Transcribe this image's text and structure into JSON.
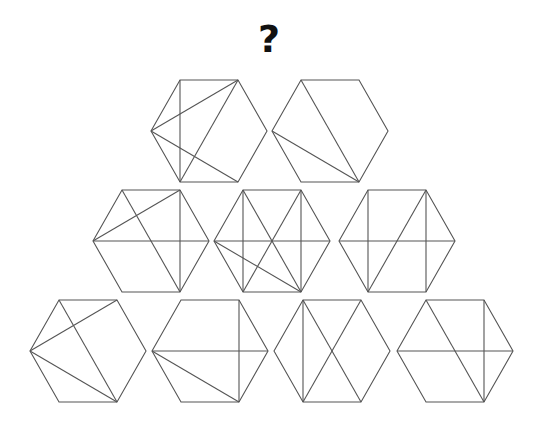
{
  "question_mark": "?",
  "style": {
    "line_color": "#555555",
    "line_width": 1.1,
    "background": "#ffffff",
    "question_color": "#111111"
  },
  "hex_geometry": {
    "half_width": 58,
    "vertex_dx": 29,
    "half_height": 51,
    "vertex_order": [
      "TL",
      "TR",
      "R",
      "BR",
      "BL",
      "L"
    ]
  },
  "rows": [
    {
      "row": 1,
      "center_y": 131,
      "hexagons": [
        {
          "id": "A",
          "cx": 209,
          "diagonals": [
            [
              "TL",
              "BL"
            ],
            [
              "L",
              "TR"
            ],
            [
              "L",
              "BR"
            ],
            [
              "TR",
              "BL"
            ]
          ]
        },
        {
          "id": "B",
          "cx": 330,
          "diagonals": [
            [
              "TL",
              "BR"
            ],
            [
              "L",
              "BR"
            ]
          ]
        }
      ]
    },
    {
      "row": 2,
      "center_y": 241,
      "hexagons": [
        {
          "id": "C",
          "cx": 151,
          "diagonals": [
            [
              "TL",
              "BR"
            ],
            [
              "L",
              "TR"
            ],
            [
              "L",
              "R"
            ],
            [
              "TR",
              "BR"
            ]
          ]
        },
        {
          "id": "D",
          "cx": 272,
          "diagonals": [
            [
              "TL",
              "BL"
            ],
            [
              "TR",
              "BR"
            ],
            [
              "L",
              "R"
            ],
            [
              "TL",
              "BR"
            ],
            [
              "TR",
              "BL"
            ],
            [
              "L",
              "BR"
            ]
          ]
        },
        {
          "id": "E",
          "cx": 397,
          "diagonals": [
            [
              "TL",
              "BL"
            ],
            [
              "TR",
              "BR"
            ],
            [
              "L",
              "R"
            ],
            [
              "TR",
              "BL"
            ]
          ]
        }
      ]
    },
    {
      "row": 3,
      "center_y": 351,
      "hexagons": [
        {
          "id": "F",
          "cx": 88,
          "diagonals": [
            [
              "L",
              "TR"
            ],
            [
              "TL",
              "BR"
            ],
            [
              "L",
              "BR"
            ]
          ]
        },
        {
          "id": "G",
          "cx": 210,
          "diagonals": [
            [
              "L",
              "R"
            ],
            [
              "TR",
              "BR"
            ],
            [
              "L",
              "BR"
            ]
          ]
        },
        {
          "id": "H",
          "cx": 332,
          "diagonals": [
            [
              "TL",
              "BL"
            ],
            [
              "TL",
              "BR"
            ],
            [
              "TR",
              "BL"
            ]
          ]
        },
        {
          "id": "I",
          "cx": 455,
          "diagonals": [
            [
              "L",
              "R"
            ],
            [
              "TL",
              "BR"
            ],
            [
              "TR",
              "BR"
            ]
          ]
        }
      ]
    }
  ]
}
